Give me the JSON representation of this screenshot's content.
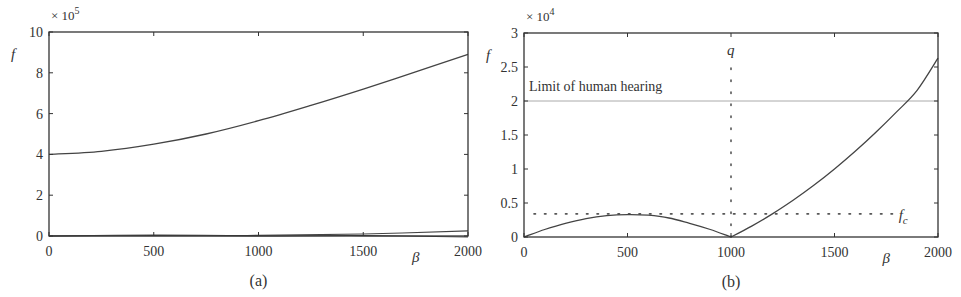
{
  "chart_data": [
    {
      "id": "a",
      "type": "line",
      "caption": "(a)",
      "title": "",
      "xlabel": "β",
      "ylabel": "f",
      "y_multiplier": "× 10",
      "y_multiplier_exp": "5",
      "xlim": [
        0,
        2000
      ],
      "ylim": [
        0,
        10
      ],
      "x_ticks": [
        0,
        500,
        1000,
        1500,
        2000
      ],
      "y_ticks": [
        0,
        2,
        4,
        6,
        8,
        10
      ],
      "grid": false,
      "series": [
        {
          "name": "upper branch",
          "x": [
            0,
            250,
            500,
            750,
            1000,
            1250,
            1500,
            1750,
            2000
          ],
          "values": [
            4.0,
            4.15,
            4.5,
            5.0,
            5.65,
            6.4,
            7.2,
            8.05,
            8.9
          ]
        },
        {
          "name": "lower branch 1",
          "x": [
            0,
            500,
            1000,
            1500,
            2000
          ],
          "values": [
            0.0,
            0.05,
            0.03,
            0.1,
            0.25
          ]
        },
        {
          "name": "lower branch 2",
          "x": [
            0,
            500,
            1000,
            1500,
            2000
          ],
          "values": [
            0.0,
            0.02,
            0.0,
            0.02,
            -0.05
          ]
        }
      ],
      "box_px": {
        "x0": 49,
        "y0": 32,
        "x1": 468,
        "y1": 236
      }
    },
    {
      "id": "b",
      "type": "line",
      "caption": "(b)",
      "title": "",
      "xlabel": "β",
      "ylabel": "f",
      "y_multiplier": "× 10",
      "y_multiplier_exp": "4",
      "xlim": [
        0,
        2000
      ],
      "ylim": [
        0,
        3
      ],
      "x_ticks": [
        0,
        500,
        1000,
        1500,
        2000
      ],
      "y_ticks": [
        0,
        0.5,
        1,
        1.5,
        2,
        2.5,
        3
      ],
      "y_tick_labels": [
        "0",
        "0.5",
        "1",
        "1.5",
        "2",
        "2.5",
        "3"
      ],
      "grid": false,
      "series": [
        {
          "name": "frequency",
          "x": [
            0,
            100,
            200,
            300,
            400,
            500,
            600,
            700,
            800,
            900,
            1000,
            1100,
            1200,
            1300,
            1400,
            1500,
            1600,
            1700,
            1800,
            1900,
            2000
          ],
          "values": [
            0.0,
            0.11,
            0.2,
            0.27,
            0.315,
            0.33,
            0.32,
            0.28,
            0.2,
            0.11,
            0.0,
            0.16,
            0.34,
            0.54,
            0.76,
            1.0,
            1.26,
            1.54,
            1.84,
            2.16,
            2.63
          ]
        }
      ],
      "reference_lines": [
        {
          "type": "horizontal",
          "value": 2.0,
          "style": "solid-light",
          "label": "Limit of human hearing"
        },
        {
          "type": "horizontal",
          "value": 0.34,
          "style": "dotted",
          "label": "f",
          "label_sub": "c"
        },
        {
          "type": "vertical",
          "value": 1000,
          "style": "dotted",
          "label": "q"
        }
      ],
      "box_px": {
        "x0": 524,
        "y0": 33,
        "x1": 938,
        "y1": 237
      }
    }
  ]
}
